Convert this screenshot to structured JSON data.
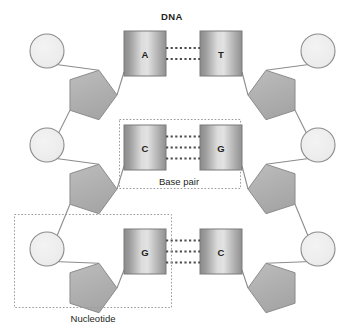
{
  "diagram": {
    "title": "DNA",
    "title_pos": {
      "x": 172,
      "y": 16
    },
    "canvas": {
      "width": 345,
      "height": 333
    },
    "colors": {
      "background": "#ffffff",
      "text": "#231f20",
      "phosphate_fill": "#ececec",
      "phosphate_stroke": "#8c8c8c",
      "sugar_fill": "#b3b3b3",
      "sugar_stroke": "#8c8c8c",
      "base_dark": "#8a8a8a",
      "base_light": "#e2e2e2",
      "base_stroke": "#7a7a7a",
      "bond_line": "#4d4d4d",
      "backbone_line": "#8c8c8c",
      "annotation_box": "#9b9b9b"
    },
    "components": {
      "phosphate_label": "phosphate",
      "sugar_label": "deoxyribose-sugar",
      "base_label": "nitrogenous-base",
      "hydrogen_bond_label": "hydrogen-bond"
    },
    "rows": [
      {
        "id": "row-1",
        "left_base": "A",
        "right_base": "T",
        "hydrogen_bonds": 2,
        "left_base_box": {
          "x": 124,
          "y": 31,
          "w": 42,
          "h": 45
        },
        "right_base_box": {
          "x": 200,
          "y": 31,
          "w": 42,
          "h": 45
        },
        "left_phosphate": {
          "cx": 47,
          "cy": 51,
          "r": 17
        },
        "right_phosphate": {
          "cx": 318,
          "cy": 51,
          "r": 17
        },
        "left_sugar": {
          "cx": 91,
          "cy": 95,
          "r": 26,
          "rot": 18
        },
        "right_sugar": {
          "cx": 274,
          "cy": 95,
          "r": 26,
          "rot": -18
        }
      },
      {
        "id": "row-2",
        "left_base": "C",
        "right_base": "G",
        "hydrogen_bonds": 3,
        "left_base_box": {
          "x": 124,
          "y": 125,
          "w": 42,
          "h": 45
        },
        "right_base_box": {
          "x": 200,
          "y": 125,
          "w": 42,
          "h": 45
        },
        "left_phosphate": {
          "cx": 47,
          "cy": 145,
          "r": 17
        },
        "right_phosphate": {
          "cx": 318,
          "cy": 145,
          "r": 17
        },
        "left_sugar": {
          "cx": 91,
          "cy": 189,
          "r": 26,
          "rot": 18
        },
        "right_sugar": {
          "cx": 274,
          "cy": 189,
          "r": 26,
          "rot": -18
        }
      },
      {
        "id": "row-3",
        "left_base": "G",
        "right_base": "C",
        "hydrogen_bonds": 3,
        "left_base_box": {
          "x": 124,
          "y": 229,
          "w": 42,
          "h": 45
        },
        "right_base_box": {
          "x": 200,
          "y": 229,
          "w": 42,
          "h": 45
        },
        "left_phosphate": {
          "cx": 47,
          "cy": 249,
          "r": 17
        },
        "right_phosphate": {
          "cx": 318,
          "cy": 249,
          "r": 17
        },
        "left_sugar": {
          "cx": 91,
          "cy": 288,
          "r": 26,
          "rot": 18
        },
        "right_sugar": {
          "cx": 274,
          "cy": 288,
          "r": 26,
          "rot": -18
        }
      }
    ],
    "annotations": [
      {
        "id": "base-pair",
        "label": "Base pair",
        "box": {
          "x": 119,
          "y": 119,
          "w": 121,
          "h": 69
        },
        "label_pos": {
          "x": 179,
          "y": 181
        },
        "label_anchor": "inside-bottom"
      },
      {
        "id": "nucleotide",
        "label": "Nucleotide",
        "box": {
          "x": 14,
          "y": 214,
          "w": 157,
          "h": 93
        },
        "label_pos": {
          "x": 93,
          "y": 318
        },
        "label_anchor": "below"
      }
    ]
  }
}
